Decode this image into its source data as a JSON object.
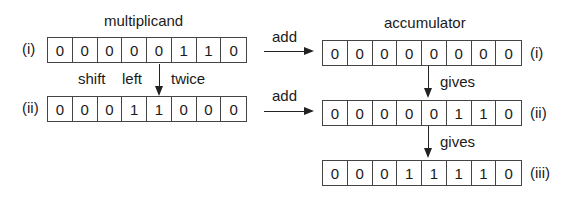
{
  "multiplicand": {
    "title": "multiplicand",
    "rows": [
      {
        "label": "(i)",
        "bits": [
          "0",
          "0",
          "0",
          "0",
          "0",
          "1",
          "1",
          "0"
        ]
      },
      {
        "label": "(ii)",
        "bits": [
          "0",
          "0",
          "0",
          "1",
          "1",
          "0",
          "0",
          "0"
        ]
      }
    ],
    "shift_text": {
      "word1": "shift",
      "word2": "left",
      "word3": "twice"
    }
  },
  "accumulator": {
    "title": "accumulator",
    "rows": [
      {
        "label": "(i)",
        "bits": [
          "0",
          "0",
          "0",
          "0",
          "0",
          "0",
          "0",
          "0"
        ]
      },
      {
        "label": "(ii)",
        "bits": [
          "0",
          "0",
          "0",
          "0",
          "0",
          "1",
          "1",
          "0"
        ]
      },
      {
        "label": "(iii)",
        "bits": [
          "0",
          "0",
          "0",
          "1",
          "1",
          "1",
          "1",
          "0"
        ]
      }
    ],
    "gives_label": "gives"
  },
  "arrows": {
    "add_label": "add"
  }
}
